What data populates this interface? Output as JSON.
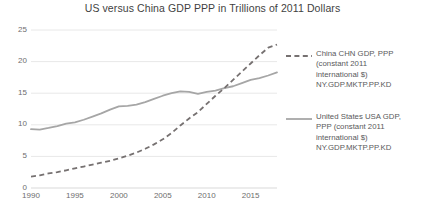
{
  "chart_data": {
    "type": "line",
    "title": "US versus China GDP PPP in Trillions of 2011 Dollars",
    "xlabel": "",
    "ylabel": "",
    "xlim": [
      1990,
      2018
    ],
    "ylim": [
      0,
      25
    ],
    "grid": true,
    "legend_position": "right",
    "y_ticks": [
      "25",
      "20",
      "15",
      "10",
      "5",
      "0"
    ],
    "x_ticks": [
      "1990",
      "1995",
      "2000",
      "2005",
      "2010",
      "2015"
    ],
    "x": [
      1990,
      1991,
      1992,
      1993,
      1994,
      1995,
      1996,
      1997,
      1998,
      1999,
      2000,
      2001,
      2002,
      2003,
      2004,
      2005,
      2006,
      2007,
      2008,
      2009,
      2010,
      2011,
      2012,
      2013,
      2014,
      2015,
      2016,
      2017,
      2018
    ],
    "series": [
      {
        "name": "China CHN GDP, PPP (constant 2011 international $) NY.GDP.MKTP.PP.KD",
        "style": "dashed",
        "color": "#767171",
        "values": [
          1.8,
          2.0,
          2.3,
          2.5,
          2.8,
          3.1,
          3.4,
          3.7,
          4.0,
          4.3,
          4.7,
          5.1,
          5.6,
          6.2,
          6.9,
          7.7,
          8.7,
          9.9,
          11.0,
          12.0,
          13.3,
          14.6,
          15.8,
          17.1,
          18.4,
          19.7,
          21.0,
          22.2,
          22.7
        ]
      },
      {
        "name": "United States USA GDP, PPP (constant 2011 international $) NY.GDP.MKTP.PP.KD",
        "style": "solid",
        "color": "#a6a6a6",
        "values": [
          9.3,
          9.25,
          9.5,
          9.8,
          10.2,
          10.4,
          10.8,
          11.3,
          11.8,
          12.4,
          12.9,
          13.0,
          13.2,
          13.6,
          14.1,
          14.6,
          15.0,
          15.3,
          15.2,
          14.9,
          15.2,
          15.4,
          15.8,
          16.1,
          16.6,
          17.1,
          17.4,
          17.8,
          18.3
        ]
      }
    ],
    "legend": [
      {
        "key": "china",
        "style": "dashed",
        "color": "#767171",
        "label": "China CHN GDP, PPP\n(constant 2011\ninternational $)\nNY.GDP.MKTP.PP.KD"
      },
      {
        "key": "us",
        "style": "solid",
        "color": "#a6a6a6",
        "label": "United States USA GDP,\nPPP (constant 2011\ninternational $)\nNY.GDP.MKTP.PP.KD"
      }
    ]
  }
}
